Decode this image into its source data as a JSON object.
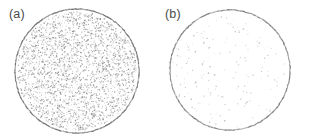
{
  "figure": {
    "width": 309,
    "height": 138,
    "background_color": "#ffffff",
    "type": "scientific-figure"
  },
  "panels": [
    {
      "id": "a",
      "label": "(a)",
      "label_color": "#4a4a4a",
      "circle": {
        "cx": 77,
        "cy": 71,
        "r": 62,
        "outline_color": "#6b6b6b",
        "outline_width": 1.1
      },
      "points": {
        "count": 2600,
        "color": "#8c8c8c",
        "radius": 0.55,
        "density": "dense",
        "seed": 17
      }
    },
    {
      "id": "b",
      "label": "(b)",
      "label_color": "#4a4a4a",
      "circle": {
        "cx": 75,
        "cy": 70,
        "r": 60,
        "outline_color": "#7a7a7a",
        "outline_width": 1.1
      },
      "points": {
        "count": 170,
        "color": "#b9b9b9",
        "radius": 0.6,
        "density": "sparse",
        "seed": 91
      }
    }
  ],
  "chart_data": {
    "type": "scatter",
    "title": "",
    "xlabel": "",
    "ylabel": "",
    "grid": false,
    "legend": null,
    "annotations": [
      "(a)",
      "(b)"
    ],
    "subplots": [
      {
        "name": "(a)",
        "shape": "circular-aperture",
        "point_count": 2600,
        "point_color": "#8c8c8c",
        "fill_description": "uniformly distributed dense random speckle filling the disc",
        "boundary": "solid grey circle outline",
        "center_px": [
          77,
          71
        ],
        "radius_px": 62
      },
      {
        "name": "(b)",
        "shape": "circular-aperture",
        "point_count": 170,
        "point_color": "#b9b9b9",
        "fill_description": "very sparse faint random speckle inside the disc",
        "boundary": "solid grey circle outline",
        "center_px": [
          75,
          70
        ],
        "radius_px": 60
      }
    ]
  }
}
